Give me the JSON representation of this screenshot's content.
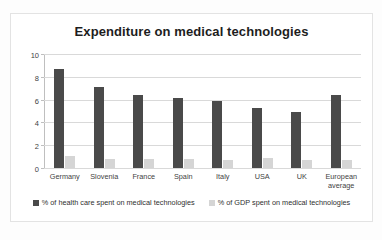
{
  "chart_data": {
    "type": "bar",
    "title": "Expenditure on medical technologies",
    "xlabel": "",
    "ylabel": "",
    "ylim": [
      0,
      10
    ],
    "yticks": [
      0,
      2,
      4,
      6,
      8,
      10
    ],
    "grid": true,
    "legend_position": "bottom",
    "categories": [
      "Germany",
      "Slovenia",
      "France",
      "Spain",
      "Italy",
      "USA",
      "UK",
      "European average"
    ],
    "series": [
      {
        "name": "% of health care spent on medical technologies",
        "color": "#4a4a4a",
        "values": [
          8.8,
          7.2,
          6.5,
          6.2,
          5.9,
          5.3,
          5.0,
          6.5
        ]
      },
      {
        "name": "% of GDP spent on medical technologies",
        "color": "#d5d5d5",
        "values": [
          1.05,
          0.8,
          0.8,
          0.8,
          0.75,
          0.9,
          0.7,
          0.75
        ]
      }
    ]
  }
}
